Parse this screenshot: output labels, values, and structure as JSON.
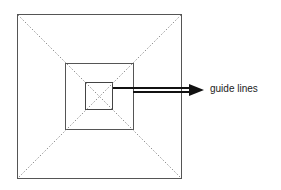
{
  "diagram": {
    "title": "",
    "annotation": {
      "label": "guide lines",
      "target": "diagonal guide lines of nested squares"
    },
    "shapes": {
      "outer_square": {
        "x": 17,
        "y": 14,
        "w": 164,
        "h": 164
      },
      "middle_square": {
        "x": 65,
        "y": 63,
        "w": 68,
        "h": 66
      },
      "inner_square": {
        "x": 85,
        "y": 82,
        "w": 27,
        "h": 27
      }
    },
    "colors": {
      "stroke": "#555555",
      "arrow": "#111111",
      "dotted": "#777777"
    }
  }
}
